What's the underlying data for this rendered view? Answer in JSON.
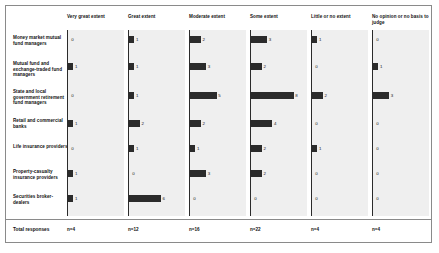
{
  "chart_data": {
    "type": "bar",
    "title": "",
    "xlabel": "",
    "ylabel": "",
    "orientation": "horizontal",
    "grid": false,
    "legend_position": "none",
    "panel_layout": "small-multiples-by-response-category",
    "categories": [
      "Money market mutual fund managers",
      "Mutual fund and exchange-traded fund managers",
      "State and local government retirement fund managers",
      "Retail and commercial banks",
      "Life insurance providers",
      "Property-casualty insurance providers",
      "Securities broker-dealers"
    ],
    "series": [
      {
        "name": "Very great extent",
        "values": [
          0,
          1,
          0,
          1,
          0,
          1,
          1
        ],
        "total_label": "n=4"
      },
      {
        "name": "Great extent",
        "values": [
          1,
          1,
          1,
          2,
          1,
          0,
          6
        ],
        "total_label": "n=12"
      },
      {
        "name": "Moderate extent",
        "values": [
          2,
          3,
          5,
          2,
          1,
          3,
          0
        ],
        "total_label": "n=16"
      },
      {
        "name": "Some extent",
        "values": [
          3,
          2,
          8,
          4,
          2,
          2,
          0
        ],
        "total_label": "n=22"
      },
      {
        "name": "Little or no extent",
        "values": [
          1,
          0,
          2,
          0,
          1,
          0,
          0
        ],
        "total_label": "n=4"
      },
      {
        "name": "No opinion or no basis to judge",
        "values": [
          0,
          1,
          3,
          0,
          0,
          0,
          0
        ],
        "total_label": "n=4"
      }
    ],
    "xlim": [
      0,
      8
    ],
    "bar_color": "#2b2b2b",
    "panel_background": "#efefef"
  },
  "table": {
    "row_header_label": "",
    "totals_row_label": "Total responses",
    "column_headers": [
      "Very great extent",
      "Great extent",
      "Moderate extent",
      "Some extent",
      "Little or no extent",
      "No opinion or no basis to judge"
    ],
    "row_labels": [
      "Money market mutual fund managers",
      "Mutual fund and exchange-traded fund managers",
      "State and local government retirement fund managers",
      "Retail and commercial banks",
      "Life insurance providers",
      "Property-casualty insurance providers",
      "Securities broker-dealers"
    ],
    "totals": [
      "n=4",
      "n=12",
      "n=16",
      "n=22",
      "n=4",
      "n=4"
    ]
  }
}
